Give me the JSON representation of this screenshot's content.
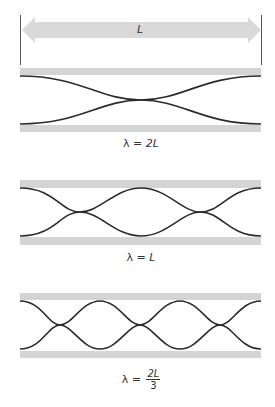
{
  "diagram": {
    "length_label": "L",
    "colors": {
      "bar": "#d4d4d4",
      "arrow": "#d9d9d9",
      "wave": "#2b2b2b",
      "boundary_line": "#555555"
    },
    "panels": [
      {
        "id": "fundamental",
        "label_prefix": "λ = ",
        "label_value": "2L",
        "half_wavelengths": 1
      },
      {
        "id": "second-harmonic",
        "label_prefix": "λ = ",
        "label_value": "L",
        "half_wavelengths": 2
      },
      {
        "id": "third-harmonic",
        "label_prefix": "λ = ",
        "label_numerator": "2L",
        "label_denominator": "3",
        "half_wavelengths": 3
      }
    ]
  }
}
